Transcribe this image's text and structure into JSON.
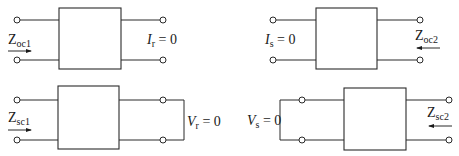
{
  "diagram": {
    "panels": [
      {
        "id": "oc1",
        "impedance_label": {
          "main": "Z",
          "sub": "oc1"
        },
        "condition_label": {
          "var": "I",
          "sub": "r",
          "rest": " = 0"
        },
        "arrow_direction": "right"
      },
      {
        "id": "oc2",
        "impedance_label": {
          "main": "Z",
          "sub": "oc2"
        },
        "condition_label": {
          "var": "I",
          "sub": "s",
          "rest": " = 0"
        },
        "arrow_direction": "left"
      },
      {
        "id": "sc1",
        "impedance_label": {
          "main": "Z",
          "sub": "sc1"
        },
        "condition_label": {
          "var": "V",
          "sub": "r",
          "rest": " = 0"
        },
        "arrow_direction": "right"
      },
      {
        "id": "sc2",
        "impedance_label": {
          "main": "Z",
          "sub": "sc2"
        },
        "condition_label": {
          "var": "V",
          "sub": "s",
          "rest": " = 0"
        },
        "arrow_direction": "left"
      }
    ]
  }
}
